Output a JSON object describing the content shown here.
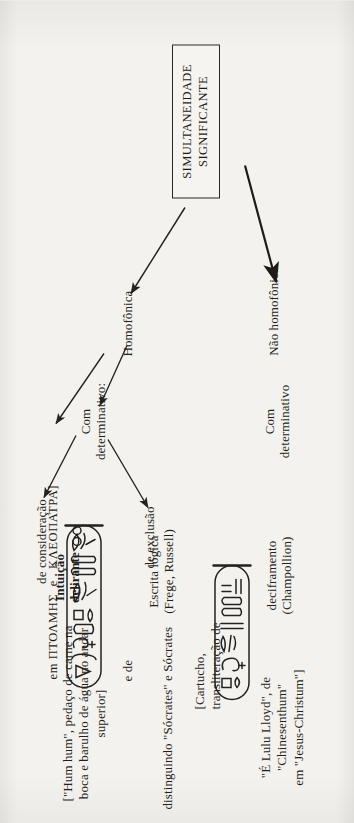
{
  "figure": {
    "root": "SIMULTANEIDADE\nSIGNIFICANTE",
    "branches": {
      "homofonica": "Homofônica",
      "nao_homofonica": "Não homofônica"
    },
    "determinative_level": {
      "com_determinativo_1": "Com\ndeterminativo:",
      "com_determinativo_2": "Com\ndeterminativo"
    },
    "determinative_kinds": {
      "de_consideracao": "de consideração",
      "de_exclusao": "de exclusão"
    },
    "outcomes": {
      "deciframento": "deciframento\n(Champollion)",
      "escrita_logica": "Escrita lógica\n(Frege, Russell)",
      "intuicao_delirante": "Intuição\ndelirante"
    },
    "examples": {
      "lulu_lloyd": "\"É Lulu Lloyd\", de \"Chinesenthum\"\nem \"Jesus-Christum\"]",
      "cartucho_label": "[Cartucho,\ntransliteração de",
      "e_de": "e de",
      "greek_line": "em ΠΤΟΛΜΗΣ  e   ΚΛΕΟΠΑΤΡΑ]",
      "socrates": "distinguindo \"Sócrates\" e Sócrates",
      "hum_hum": "[\"Hum hum\", pedaço de carne na\nboca e barulho de água no andar\nsuperior]"
    },
    "glyph_names": {
      "cartouche_ptolemy": "cartouche-ptolemy-hieroglyphs",
      "cartouche_cleopatra": "cartouche-cleopatra-hieroglyphs"
    },
    "colors": {
      "ink": "#221f1d",
      "paper": "#f4f2ee",
      "rule": "#2a2724"
    }
  }
}
